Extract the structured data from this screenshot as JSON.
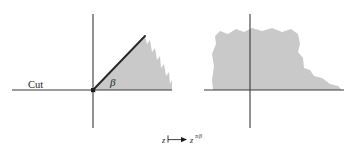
{
  "figure": {
    "kind": "conformal-mapping-diagram",
    "background_color": "#ffffff",
    "shade_color": "#c9c9c9",
    "axis_color": "#3a3a3a",
    "ink_color": "#1d1d1d",
    "labels": {
      "cut": "Cut",
      "beta": "β"
    },
    "caption": {
      "source_variable": "z",
      "maps_to_symbol": "⟼",
      "image_variable": "z",
      "exponent": "π/β",
      "full_text": "z ⟼ z^(π/β)"
    },
    "panels": [
      {
        "id": "source-plane",
        "name": "wedge-domain",
        "description": "Sector of opening angle beta above the positive real axis, with a branch cut along the negative real axis",
        "origin": {
          "x": 93,
          "y": 90
        },
        "angle_label": "β",
        "cut_label": "Cut",
        "x_axis": {
          "x1": 12,
          "y1": 90,
          "x2": 172,
          "y2": 90
        },
        "y_axis": {
          "x1": 93,
          "y1": 14,
          "x2": 93,
          "y2": 128
        },
        "ray": {
          "x1": 93,
          "y1": 90,
          "x2": 145,
          "y2": 36
        },
        "shade_outline": "93,90 145,36 147,44 150,40 152,52 155,48 157,60 160,56 161,68 164,64 166,76 169,72 170,84 172,80 172,90"
      },
      {
        "id": "image-plane",
        "name": "half-plane-domain",
        "description": "Upper half-plane image after the power map, bounded below by the real axis",
        "origin": {
          "x": 250,
          "y": 90
        },
        "x_axis": {
          "x1": 204,
          "y1": 90,
          "x2": 344,
          "y2": 90
        },
        "y_axis": {
          "x1": 250,
          "y1": 14,
          "x2": 250,
          "y2": 128
        },
        "shade_outline": "213,90 212,80 214,66 212,54 216,44 215,36 220,31 228,34 236,29 244,32 252,28 262,31 272,28 282,32 291,29 298,34 300,44 298,52 303,58 304,68 310,70 314,76 322,78 330,84 338,86 342,90"
      }
    ]
  }
}
